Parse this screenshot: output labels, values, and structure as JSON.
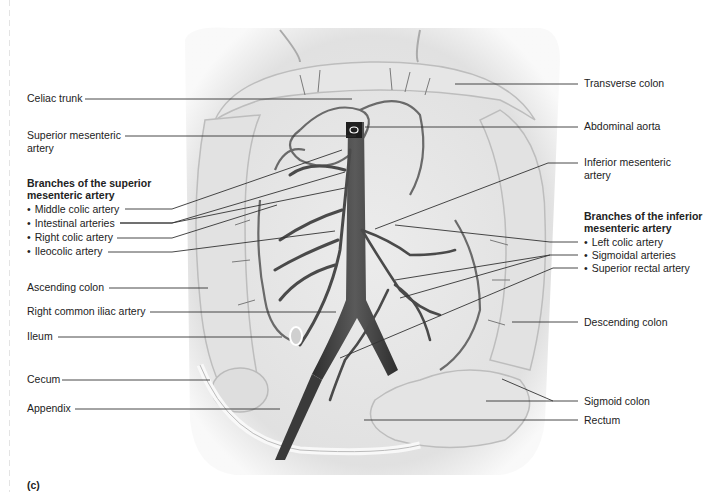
{
  "figure": {
    "panel_label": "(c)",
    "left_labels": {
      "celiac_trunk": "Celiac trunk",
      "superior_mesenteric_artery": [
        "Superior mesenteric",
        "artery"
      ],
      "sma_branches_heading": [
        "Branches of the superior",
        "mesenteric artery"
      ],
      "sma_branches": [
        "Middle colic artery",
        "Intestinal arteries",
        "Right colic artery",
        "Ileocolic artery"
      ],
      "ascending_colon": "Ascending colon",
      "right_common_iliac_artery": "Right common iliac artery",
      "ileum": "Ileum",
      "cecum": "Cecum",
      "appendix": "Appendix"
    },
    "right_labels": {
      "transverse_colon": "Transverse colon",
      "abdominal_aorta": "Abdominal aorta",
      "inferior_mesenteric_artery": [
        "Inferior mesenteric",
        "artery"
      ],
      "ima_branches_heading": [
        "Branches of the inferior",
        "mesenteric artery"
      ],
      "ima_branches": [
        "Left colic artery",
        "Sigmoidal arteries",
        "Superior rectal artery"
      ],
      "descending_colon": "Descending colon",
      "sigmoid_colon": "Sigmoid colon",
      "rectum": "Rectum"
    },
    "colors": {
      "artery": "#4a4a4a",
      "aorta": "#3a3a3a",
      "tissue_light": "#e8e8e8",
      "tissue_mid": "#cfcfcf",
      "leader_line": "#333333"
    }
  }
}
